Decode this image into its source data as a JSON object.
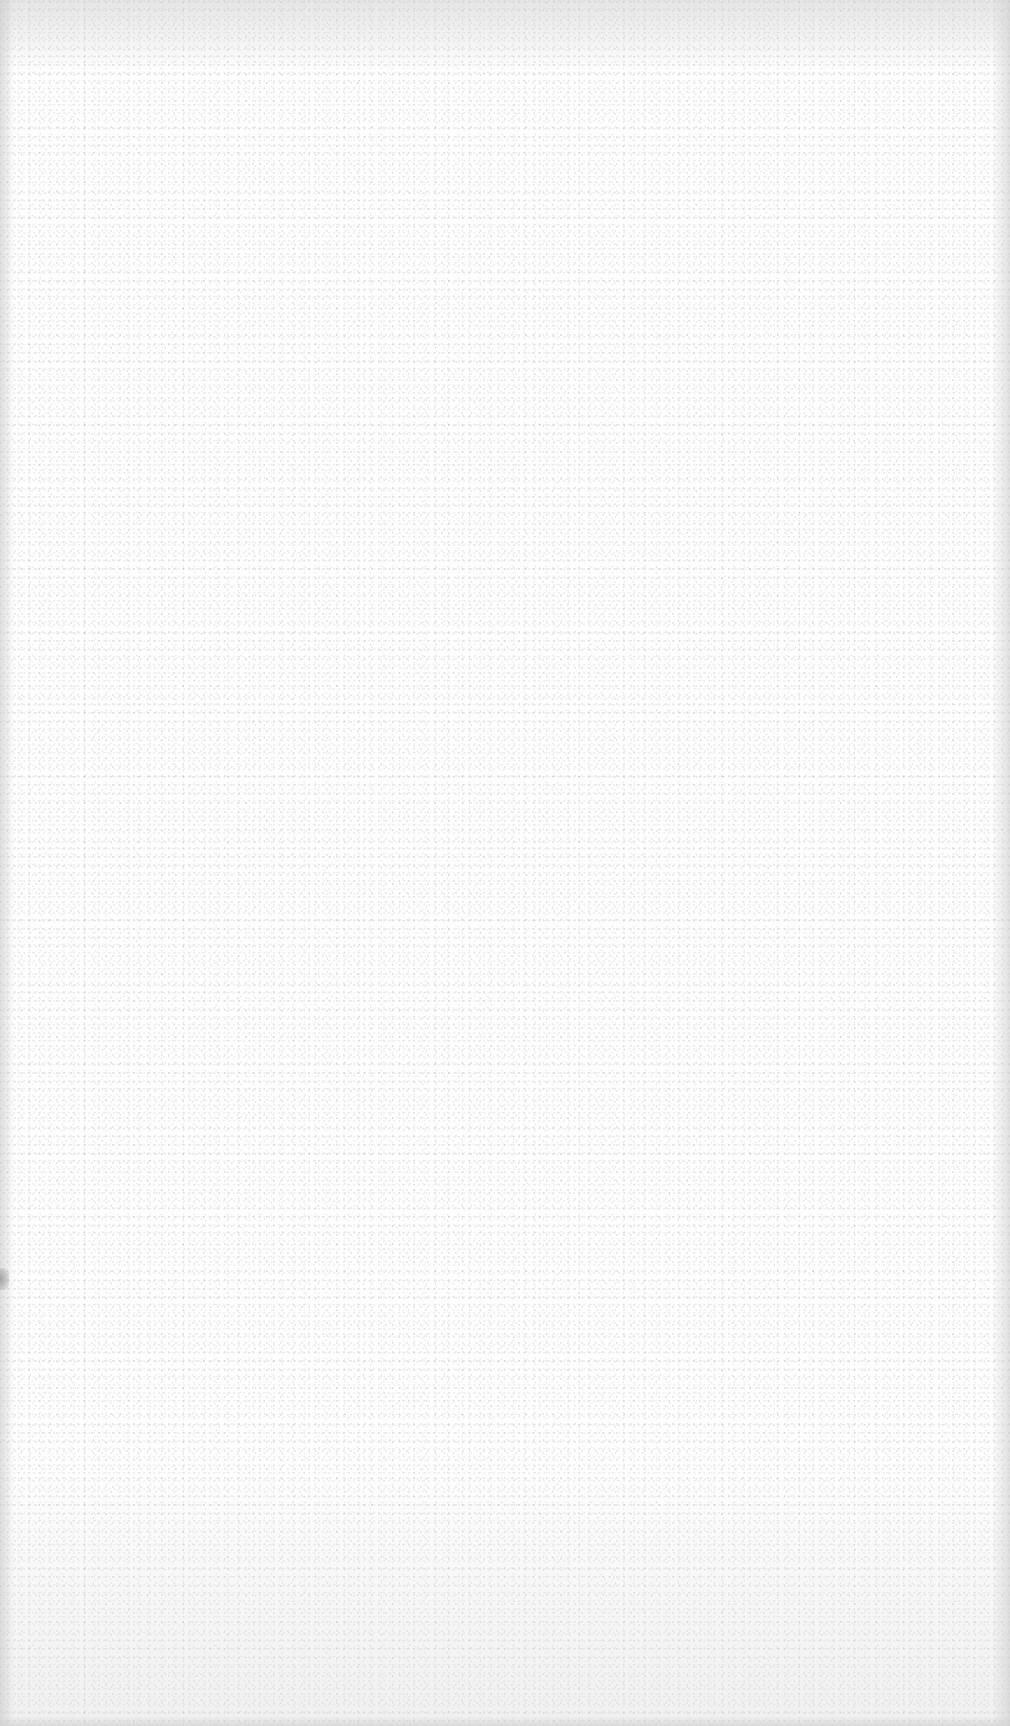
{
  "page": {
    "kind": "blank-paper-sheet",
    "text_content": [],
    "colors": {
      "paper": "#fdfdfd",
      "grain": "#787878",
      "edge_shadow": "#c8c8c8",
      "smudge": "#6e6e6e"
    }
  }
}
